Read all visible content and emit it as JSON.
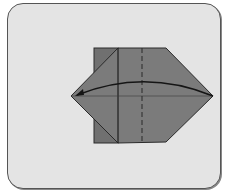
{
  "diagram": {
    "type": "origami-folding-step",
    "colors": {
      "background": "#e4e4e4",
      "paper": "#7a7a7a",
      "paper_flap": "#6f6f6f",
      "line": "#1e1e1e",
      "frame_border": "#555555"
    },
    "elements": {
      "fold_line": "dashed-vertical",
      "arrow": "curved-arrow-right-to-left"
    }
  }
}
